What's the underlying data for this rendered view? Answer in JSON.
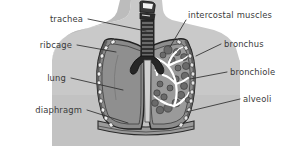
{
  "diagram": {
    "background_color": "#ffffff",
    "text_color": "#3a3a3a",
    "leader_color": "#2e2e2e",
    "palette": {
      "body_silhouette": "#c9c9c9",
      "body_silhouette_dark": "#b4b4b4",
      "lung_fill": "#8a8a8a",
      "lung_outline": "#2b2b2b",
      "pleura_band": "#6e6e6e",
      "rib_bead": "#efefef",
      "trachea_dark": "#2a2a2a",
      "trachea_ring": "#7e7e7e",
      "alveoli_cluster": "#6a6a6a",
      "bronchial_tree": "#ffffff",
      "diaphragm": "#9a9a9a"
    }
  },
  "labels": [
    {
      "id": "trachea",
      "text": "trachea",
      "side": "right-aligned",
      "x": 83,
      "y": 19,
      "lx1": 88,
      "ly1": 19,
      "lx2": 146,
      "ly2": 31
    },
    {
      "id": "ribcage",
      "text": "ribcage",
      "side": "right-aligned",
      "x": 72,
      "y": 45,
      "lx1": 77,
      "ly1": 45,
      "lx2": 116,
      "ly2": 52
    },
    {
      "id": "lung",
      "text": "lung",
      "side": "right-aligned",
      "x": 66,
      "y": 78,
      "lx1": 71,
      "ly1": 78,
      "lx2": 123,
      "ly2": 90
    },
    {
      "id": "diaphragm",
      "text": "diaphragm",
      "side": "right-aligned",
      "x": 82,
      "y": 110,
      "lx1": 87,
      "ly1": 110,
      "lx2": 128,
      "ly2": 123
    },
    {
      "id": "intercostal-muscles",
      "text": "intercostal muscles",
      "side": "left-aligned",
      "x": 188,
      "y": 15,
      "lx1": 186,
      "ly1": 20,
      "lx2": 170,
      "ly2": 47
    },
    {
      "id": "bronchus",
      "text": "bronchus",
      "side": "left-aligned",
      "x": 224,
      "y": 44,
      "lx1": 221,
      "ly1": 44,
      "lx2": 196,
      "ly2": 56
    },
    {
      "id": "bronchiole",
      "text": "bronchiole",
      "side": "left-aligned",
      "x": 230,
      "y": 72,
      "lx1": 227,
      "ly1": 72,
      "lx2": 190,
      "ly2": 79
    },
    {
      "id": "alveoli",
      "text": "alveoli",
      "side": "left-aligned",
      "x": 243,
      "y": 99,
      "lx1": 240,
      "ly1": 99,
      "lx2": 186,
      "ly2": 112
    }
  ],
  "structures": [
    {
      "id": "torso-silhouette",
      "name": "torso silhouette"
    },
    {
      "id": "trachea",
      "name": "trachea with cartilage rings"
    },
    {
      "id": "left-lung",
      "name": "left lung (intact view)"
    },
    {
      "id": "right-lung",
      "name": "right lung (cutaway view)"
    },
    {
      "id": "ribcage",
      "name": "ribcage cross sections"
    },
    {
      "id": "bronchial-tree",
      "name": "bronchial tree"
    },
    {
      "id": "alveoli",
      "name": "alveolar clusters"
    },
    {
      "id": "diaphragm",
      "name": "diaphragm"
    }
  ]
}
